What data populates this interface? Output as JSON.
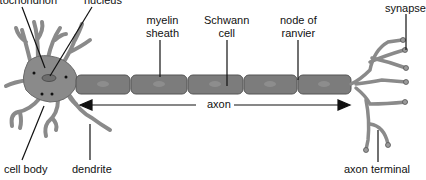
{
  "diagram": {
    "type": "neuron-anatomy",
    "labels": {
      "mitochondrion": "mitochondrion",
      "nucleus": "nucleus",
      "myelin_sheath_1": "myelin",
      "myelin_sheath_2": "sheath",
      "schwann_cell_1": "Schwann",
      "schwann_cell_2": "cell",
      "node_of_ranvier_1": "node of",
      "node_of_ranvier_2": "ranvier",
      "synapse": "synapse",
      "axon": "axon",
      "cell_body": "cell body",
      "dendrite": "dendrite",
      "axon_terminal": "axon terminal"
    },
    "colors": {
      "cell_fill": "#8a8a8a",
      "cell_stroke": "#5a5a5a",
      "segment_fill": "#7c7c7c",
      "nucleus_fill": "#6e6e6e",
      "line": "#111111"
    }
  }
}
